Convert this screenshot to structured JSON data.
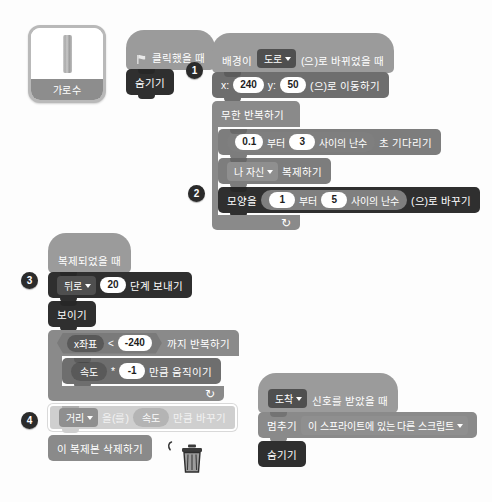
{
  "sprite": {
    "name": "가로수",
    "thumbnail_icon": "tree-trunk-icon"
  },
  "markers": [
    "1",
    "2",
    "3",
    "4"
  ],
  "icons": {
    "green_flag": "green-flag-icon",
    "trash": "trash-can-icon",
    "cursor": "mouse-cursor-icon",
    "loop_arrow": "↻"
  },
  "script_flag": {
    "hat_label": "클릭했을 때",
    "blocks": [
      {
        "label": "숨기기"
      }
    ]
  },
  "script_backdrop": {
    "hat_prefix": "배경이",
    "hat_dropdown": "도로",
    "hat_suffix": "(으)로 바뀌었을 때",
    "goto": {
      "x_label": "x:",
      "x_value": "240",
      "y_label": "y:",
      "y_value": "50",
      "suffix": "(으)로 이동하기"
    },
    "forever_label": "무한 반복하기",
    "wait": {
      "from_value": "0.1",
      "from_label": "부터",
      "to_value": "3",
      "to_label": "사이의 난수",
      "suffix": "초 기다리기"
    },
    "clone": {
      "dropdown": "나 자신",
      "suffix": "복제하기"
    },
    "switch_costume": {
      "prefix": "모양을",
      "from_value": "1",
      "from_label": "부터",
      "to_value": "5",
      "to_label": "사이의 난수",
      "suffix": "(으)로 바꾸기"
    }
  },
  "script_clone": {
    "hat_label": "복제되었을 때",
    "go_back": {
      "dropdown": "뒤로",
      "value": "20",
      "suffix": "단계 보내기"
    },
    "show_label": "보이기",
    "repeat_until": {
      "condition_left": "x좌표",
      "operator": "<",
      "condition_right": "-240",
      "suffix": "까지 반복하기",
      "move": {
        "var": "속도",
        "operator": "*",
        "value": "-1",
        "suffix": "만큼 움직이기"
      }
    },
    "change_var": {
      "dropdown": "거리",
      "particle": "을(를)",
      "value": "속도",
      "suffix": "만큼 바꾸기",
      "highlighted": true
    },
    "delete_clone_label": "이 복제본 삭제하기"
  },
  "script_receive": {
    "hat_dropdown": "도착",
    "hat_suffix": "신호를 받았을 때",
    "stop": {
      "prefix": "멈추기",
      "dropdown": "이 스프라이트에 있는 다른 스크립트"
    },
    "hide_label": "숨기기"
  },
  "colors": {
    "event": "#9b9b9b",
    "motion": "#6e6e6e",
    "looks": "#2f2f2f",
    "control": "#8a8a8a",
    "variables": "#6e6e6e",
    "highlight": "#cfcfcf",
    "background": "#fdfdfd"
  }
}
